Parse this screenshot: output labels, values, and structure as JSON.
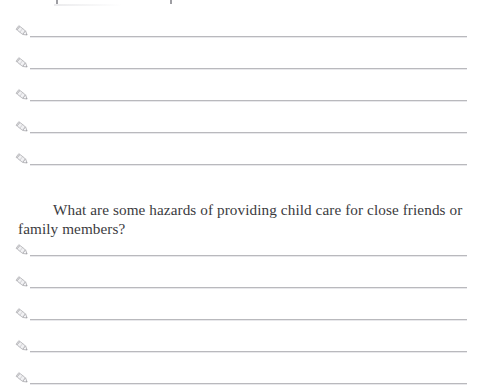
{
  "document": {
    "type": "worksheet-page",
    "background_color": "#ffffff",
    "text_color": "#3b3b3e",
    "rule_color": "#b9b9bd",
    "pencil_icon_color": "#8a8a90",
    "top_remnant_note": "cropped descenders of a previous line of text"
  },
  "answer_block_top": {
    "name": "answer-lines-upper",
    "line_count": 5,
    "lines": [
      {
        "icon": "pencil-icon",
        "value": "",
        "y": 34
      },
      {
        "icon": "pencil-icon",
        "value": "",
        "y": 66
      },
      {
        "icon": "pencil-icon",
        "value": "",
        "y": 98
      },
      {
        "icon": "pencil-icon",
        "value": "",
        "y": 130
      },
      {
        "icon": "pencil-icon",
        "value": "",
        "y": 162
      }
    ]
  },
  "question": {
    "number": "",
    "text": "What are some hazards of providing child care for close friends or family members?",
    "y": 186
  },
  "answer_block_bottom": {
    "name": "answer-lines-lower",
    "line_count": 5,
    "lines": [
      {
        "icon": "pencil-icon",
        "value": "",
        "y": 253
      },
      {
        "icon": "pencil-icon",
        "value": "",
        "y": 285
      },
      {
        "icon": "pencil-icon",
        "value": "",
        "y": 317
      },
      {
        "icon": "pencil-icon",
        "value": "",
        "y": 349
      },
      {
        "icon": "pencil-icon",
        "value": "",
        "y": 381
      }
    ]
  }
}
